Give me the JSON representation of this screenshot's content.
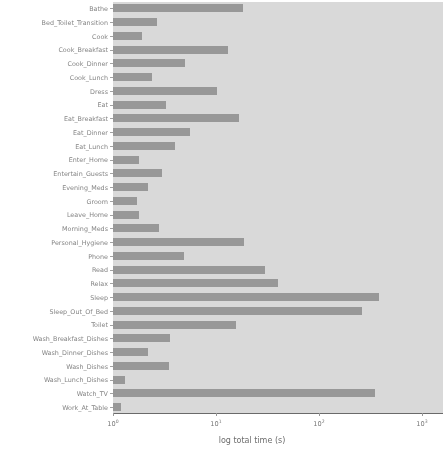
{
  "chart_data": {
    "type": "bar",
    "orientation": "horizontal",
    "title": "",
    "xlabel": "log total time (s)",
    "ylabel": "",
    "xscale": "log",
    "xlim": [
      1,
      3200
    ],
    "grid": false,
    "legend": null,
    "bar_color": "#8d8d8d",
    "plot_background": "#ebebeb",
    "xticks": [
      {
        "value": 1,
        "label": "10",
        "exp": "0"
      },
      {
        "value": 10,
        "label": "10",
        "exp": "1"
      },
      {
        "value": 100,
        "label": "10",
        "exp": "2"
      },
      {
        "value": 1000,
        "label": "10",
        "exp": "3"
      }
    ],
    "categories": [
      "Bathe",
      "Bed_Toilet_Transition",
      "Cook",
      "Cook_Breakfast",
      "Cook_Dinner",
      "Cook_Lunch",
      "Dress",
      "Eat",
      "Eat_Breakfast",
      "Eat_Dinner",
      "Eat_Lunch",
      "Enter_Home",
      "Entertain_Guests",
      "Evening_Meds",
      "Groom",
      "Leave_Home",
      "Morning_Meds",
      "Personal_Hygiene",
      "Phone",
      "Read",
      "Relax",
      "Sleep",
      "Sleep_Out_Of_Bed",
      "Toilet",
      "Wash_Breakfast_Dishes",
      "Wash_Dinner_Dishes",
      "Wash_Dishes",
      "Wash_Lunch_Dishes",
      "Watch_TV",
      "Work_At_Table"
    ],
    "values": [
      18.3,
      2.7,
      1.9,
      13.0,
      5.0,
      2.4,
      10.3,
      3.3,
      16.6,
      5.6,
      4.0,
      1.8,
      3.0,
      2.2,
      1.7,
      1.8,
      2.8,
      18.5,
      4.9,
      30.0,
      40.0,
      380.0,
      260.0,
      15.5,
      3.6,
      2.2,
      3.5,
      1.3,
      350.0,
      1.2
    ]
  },
  "ghost_text": {
    "heading": "Results",
    "line1": "Analysis",
    "line2": "and Discussion"
  }
}
